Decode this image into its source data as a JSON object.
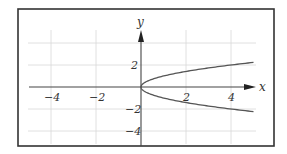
{
  "chart_data": {
    "type": "line",
    "title": "",
    "xlabel": "x",
    "ylabel": "y",
    "xlim": [
      -5,
      5
    ],
    "ylim": [
      -5,
      5
    ],
    "grid": true,
    "x_ticks": [
      -4,
      -2,
      2,
      4
    ],
    "y_ticks": [
      4,
      2,
      -2,
      -4
    ],
    "x_tick_labels": [
      "−4",
      "−2",
      "2",
      "4"
    ],
    "y_tick_labels": [
      "2",
      "−2",
      "−4"
    ],
    "series": [
      {
        "name": "x = y^2 (upper branch, y = √x)",
        "x": [
          0,
          0.25,
          0.5,
          1,
          1.5,
          2,
          2.5,
          3,
          3.5,
          4,
          4.5,
          5
        ],
        "y": [
          0,
          0.5,
          0.707,
          1,
          1.225,
          1.414,
          1.581,
          1.732,
          1.871,
          2,
          2.121,
          2.236
        ]
      },
      {
        "name": "x = y^2 (lower branch, y = −√x)",
        "x": [
          0,
          0.25,
          0.5,
          1,
          1.5,
          2,
          2.5,
          3,
          3.5,
          4,
          4.5,
          5
        ],
        "y": [
          0,
          -0.5,
          -0.707,
          -1,
          -1.225,
          -1.414,
          -1.581,
          -1.732,
          -1.871,
          -2,
          -2.121,
          -2.236
        ]
      }
    ],
    "colors": {
      "curve": "#555555",
      "axis": "#444444",
      "grid": "#d8d8d8",
      "frame": "#333333"
    }
  },
  "labels": {
    "x_axis": "x",
    "y_axis": "y",
    "x_tick_neg4": "−4",
    "x_tick_neg2": "−2",
    "x_tick_2": "2",
    "x_tick_4": "4",
    "y_tick_2": "2",
    "y_tick_neg2": "−2",
    "y_tick_neg4": "−4"
  }
}
